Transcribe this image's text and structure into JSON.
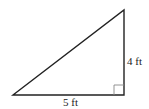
{
  "diagram": {
    "type": "right-triangle",
    "vertices": {
      "bottom_left": [
        13,
        95
      ],
      "bottom_right": [
        124,
        95
      ],
      "top": [
        124,
        10
      ]
    },
    "right_angle_at": "bottom_right",
    "labels": {
      "base": "5 ft",
      "height": "4 ft"
    },
    "colors": {
      "stroke": "#222222",
      "marker": "#888888",
      "background": "#ffffff"
    }
  }
}
